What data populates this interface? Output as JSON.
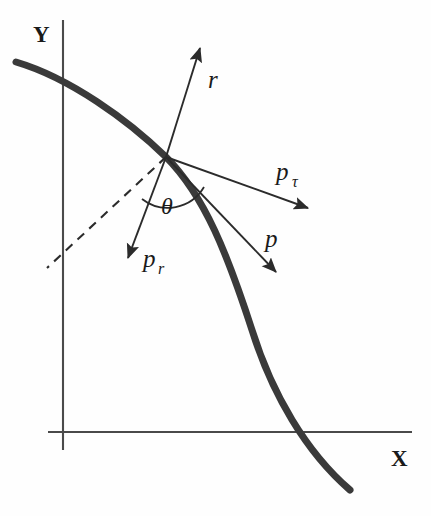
{
  "figure": {
    "kind": "vector-decomposition-diagram",
    "background_color": "#fefefe",
    "ink_color": "#2b2b2b",
    "curve_color": "#3a3a3a",
    "axis_color": "#4a4a4a",
    "width": 431,
    "height": 516
  },
  "axes": {
    "x_label": "X",
    "y_label": "Y",
    "x_label_pos": {
      "x": 391,
      "y": 466
    },
    "y_label_pos": {
      "x": 33,
      "y": 42
    },
    "x_axis": {
      "x1": 48,
      "y1": 432,
      "x2": 412,
      "y2": 432
    },
    "y_axis": {
      "x1": 63,
      "y1": 20,
      "x2": 63,
      "y2": 450
    }
  },
  "origin_point": {
    "x": 166,
    "y": 157
  },
  "curve": {
    "name": "trajectory-curve",
    "stroke_width": 7,
    "path": "M 16 62 C 70 78 128 120 166 157 C 205 196 228 256 252 330 C 272 394 306 452 350 490"
  },
  "dashed_line": {
    "name": "reference-dashed-line",
    "x1": 166,
    "y1": 157,
    "x2": 47,
    "y2": 268,
    "dash": "9 7"
  },
  "angle": {
    "symbol": "θ",
    "label_pos": {
      "x": 161,
      "y": 214
    },
    "arc_path": "M 142 199 A 42 42 0 0 0 204 187"
  },
  "vectors": [
    {
      "name": "r",
      "label": "r",
      "subscript": "",
      "from": {
        "x": 166,
        "y": 157
      },
      "to": {
        "x": 200,
        "y": 48
      },
      "label_pos": {
        "x": 208,
        "y": 88
      }
    },
    {
      "name": "p-tau",
      "label": "p",
      "subscript": "τ",
      "from": {
        "x": 166,
        "y": 157
      },
      "to": {
        "x": 308,
        "y": 208
      },
      "label_pos": {
        "x": 276,
        "y": 180
      },
      "subscript_pos": {
        "x": 292,
        "y": 187
      }
    },
    {
      "name": "p",
      "label": "p",
      "subscript": "",
      "from": {
        "x": 166,
        "y": 157
      },
      "to": {
        "x": 276,
        "y": 272
      },
      "label_pos": {
        "x": 265,
        "y": 247
      }
    },
    {
      "name": "p-r",
      "label": "p",
      "subscript": "r",
      "from": {
        "x": 166,
        "y": 157
      },
      "to": {
        "x": 128,
        "y": 258
      },
      "label_pos": {
        "x": 143,
        "y": 267
      },
      "subscript_pos": {
        "x": 158,
        "y": 274
      }
    }
  ]
}
